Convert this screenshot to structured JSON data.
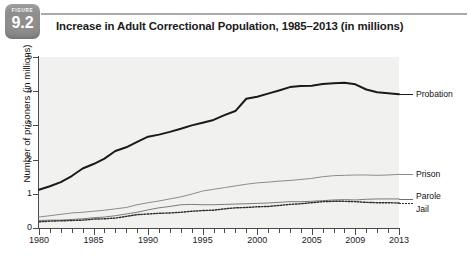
{
  "figure": {
    "kicker": "FIGURE",
    "number": "9.2",
    "title": "Increase in Adult Correctional Population, 1985–2013 (in millions)"
  },
  "colors": {
    "badge": "#8e8e8e",
    "rule": "#a9a9a9",
    "plot_background": "#f1f1ef",
    "axis": "#4a4a4a",
    "probation": "#1a1a1a",
    "prison": "#8c8c8c",
    "parole": "#6e6e6e",
    "jail": "#2b2b2b"
  },
  "chart_data": {
    "type": "line",
    "title": "Increase in Adult Correctional Population, 1985–2013 (in millions)",
    "xlabel": "",
    "ylabel": "Number of prisoners (in millions)",
    "xlim": [
      1980,
      2013
    ],
    "ylim": [
      0,
      5
    ],
    "yticks": [
      0,
      1,
      2,
      3,
      4,
      5
    ],
    "xticks": [
      1980,
      1981,
      1982,
      1983,
      1984,
      1985,
      1986,
      1987,
      1988,
      1989,
      1990,
      1991,
      1992,
      1993,
      1994,
      1995,
      1996,
      1997,
      1998,
      1999,
      2000,
      2001,
      2002,
      2003,
      2004,
      2005,
      2006,
      2007,
      2008,
      2009,
      2010,
      2011,
      2012,
      2013
    ],
    "xticklabels": [
      "1980",
      "1985",
      "1990",
      "1995",
      "2000",
      "2005",
      "2009",
      "2013"
    ],
    "xticklabel_values": [
      1980,
      1985,
      1990,
      1995,
      2000,
      2005,
      2009,
      2013
    ],
    "grid": false,
    "legend_position": "right-inline",
    "x": [
      1980,
      1981,
      1982,
      1983,
      1984,
      1985,
      1986,
      1987,
      1988,
      1989,
      1990,
      1991,
      1992,
      1993,
      1994,
      1995,
      1996,
      1997,
      1998,
      1999,
      2000,
      2001,
      2002,
      2003,
      2004,
      2005,
      2006,
      2007,
      2008,
      2009,
      2010,
      2011,
      2012,
      2013
    ],
    "series": [
      {
        "name": "Probation",
        "style": "solid-thick",
        "values": [
          1.12,
          1.22,
          1.34,
          1.52,
          1.74,
          1.87,
          2.03,
          2.25,
          2.36,
          2.52,
          2.67,
          2.73,
          2.81,
          2.9,
          3.0,
          3.08,
          3.16,
          3.3,
          3.42,
          3.78,
          3.84,
          3.93,
          4.02,
          4.12,
          4.15,
          4.16,
          4.21,
          4.23,
          4.25,
          4.2,
          4.05,
          3.97,
          3.94,
          3.91
        ]
      },
      {
        "name": "Prison",
        "style": "solid-thin-gray",
        "values": [
          0.32,
          0.36,
          0.4,
          0.44,
          0.46,
          0.49,
          0.52,
          0.56,
          0.6,
          0.68,
          0.74,
          0.79,
          0.85,
          0.91,
          0.99,
          1.08,
          1.13,
          1.18,
          1.23,
          1.28,
          1.32,
          1.34,
          1.37,
          1.39,
          1.42,
          1.45,
          1.5,
          1.53,
          1.54,
          1.55,
          1.55,
          1.54,
          1.55,
          1.57
        ]
      },
      {
        "name": "Parole",
        "style": "solid-thin",
        "values": [
          0.22,
          0.23,
          0.23,
          0.25,
          0.27,
          0.3,
          0.32,
          0.36,
          0.41,
          0.46,
          0.53,
          0.59,
          0.63,
          0.68,
          0.69,
          0.68,
          0.68,
          0.69,
          0.7,
          0.71,
          0.72,
          0.73,
          0.75,
          0.77,
          0.77,
          0.78,
          0.8,
          0.82,
          0.83,
          0.82,
          0.84,
          0.85,
          0.85,
          0.85
        ]
      },
      {
        "name": "Jail",
        "style": "dotted",
        "values": [
          0.18,
          0.2,
          0.21,
          0.22,
          0.23,
          0.26,
          0.27,
          0.29,
          0.34,
          0.39,
          0.41,
          0.43,
          0.44,
          0.46,
          0.49,
          0.51,
          0.52,
          0.56,
          0.59,
          0.6,
          0.62,
          0.63,
          0.66,
          0.69,
          0.71,
          0.74,
          0.77,
          0.78,
          0.78,
          0.77,
          0.75,
          0.74,
          0.74,
          0.73
        ]
      }
    ],
    "annotations": [
      {
        "label": "Probation",
        "x": 2013,
        "y": 3.91
      },
      {
        "label": "Prison",
        "x": 2013,
        "y": 1.57
      },
      {
        "label": "Parole",
        "x": 2013,
        "y": 0.85
      },
      {
        "label": "Jail",
        "x": 2013,
        "y": 0.73
      }
    ]
  }
}
